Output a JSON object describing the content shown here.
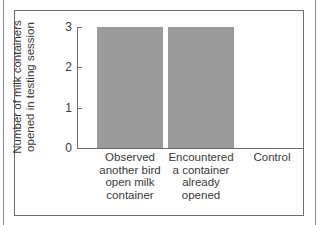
{
  "chart_data": {
    "type": "bar",
    "title": "",
    "xlabel": "",
    "ylabel": "Number of milk containers opened in testing session",
    "ylabel_lines": [
      "Number of milk containers",
      "opened in testing session"
    ],
    "categories": [
      "Observed another bird open milk container",
      "Encountered a container already opened",
      "Control"
    ],
    "category_lines": [
      [
        "Observed",
        "another bird",
        "open milk",
        "container"
      ],
      [
        "Encountered",
        "a container",
        "already",
        "opened"
      ],
      [
        "Control"
      ]
    ],
    "values": [
      3,
      3,
      0
    ],
    "ylim": [
      0,
      3
    ],
    "yticks": [
      "0",
      "1",
      "2",
      "3"
    ],
    "grid": false,
    "legend": null,
    "bar_color": "#9b9b9b"
  }
}
